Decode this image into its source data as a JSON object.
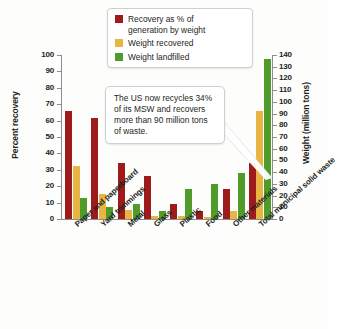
{
  "chart_data": {
    "type": "bar",
    "title": "",
    "subtitle": "",
    "categories": [
      "Paper and paperboard",
      "Yard trimmings",
      "Metal",
      "Glass",
      "Plastic",
      "Food",
      "Other materials",
      "Total municipal solid waste"
    ],
    "series": [
      {
        "name": "Recovery as % of generation by weight",
        "axis": "left",
        "unit": "percent",
        "color": "#9e1b1b",
        "values": [
          66,
          61.5,
          34,
          26,
          9,
          5,
          18,
          34
        ]
      },
      {
        "name": "Weight recovered",
        "axis": "right",
        "unit": "million tons",
        "color": "#e8b443",
        "values": [
          45,
          21,
          8,
          2.5,
          3,
          1.5,
          7,
          92
        ]
      },
      {
        "name": "Weight landfilled",
        "axis": "right",
        "unit": "million tons",
        "color": "#4f9c2a",
        "values": [
          18,
          10.5,
          13,
          7,
          26,
          30,
          39,
          137
        ]
      }
    ],
    "xlabel": "",
    "ylabel": "Percent recovery",
    "ylabel_right": "Weight (million tons)",
    "ylim": [
      0,
      100
    ],
    "ylim_right": [
      0,
      140
    ],
    "yticks": [
      0,
      10,
      20,
      30,
      40,
      50,
      60,
      70,
      80,
      90,
      100
    ],
    "yticks_right": [
      0,
      10,
      20,
      30,
      40,
      50,
      60,
      70,
      80,
      90,
      100,
      110,
      120,
      130,
      140
    ],
    "grid": false,
    "legend_position": "top-center",
    "annotations": [
      {
        "text": "The US now recycles 34% of its MSW and recovers more than 90 million tons of waste.",
        "points_to": "Total municipal solid waste"
      }
    ]
  },
  "legend": {
    "items": [
      {
        "label_line1": "Recovery as % of",
        "label_line2": "generation by weight",
        "color": "#9e1b1b",
        "swatch_name": "legend-swatch-recovery-percent"
      },
      {
        "label_line1": "Weight recovered",
        "label_line2": "",
        "color": "#e8b443",
        "swatch_name": "legend-swatch-weight-recovered"
      },
      {
        "label_line1": "Weight landfilled",
        "label_line2": "",
        "color": "#4f9c2a",
        "swatch_name": "legend-swatch-weight-landfilled"
      }
    ]
  },
  "callout": {
    "text": "The US now recycles 34% of its MSW and recovers more than 90 million tons of waste."
  },
  "axes": {
    "left_title": "Percent recovery",
    "right_title": "Weight (million tons)"
  }
}
